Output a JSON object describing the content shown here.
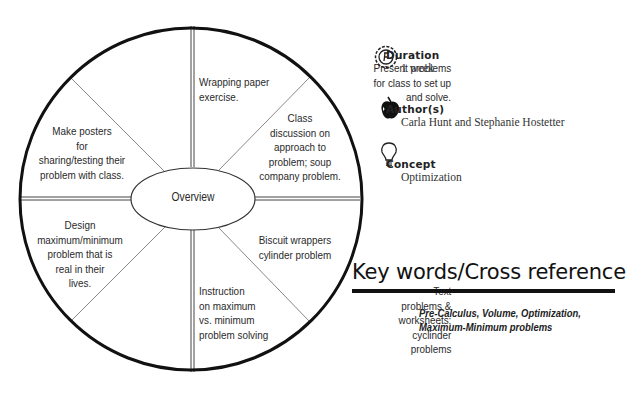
{
  "wheel": {
    "center_label": "Overview",
    "segments": [
      {
        "position": "top-left",
        "lines": [
          "Present problems",
          "for class to set up",
          "and solve."
        ]
      },
      {
        "position": "top-right",
        "lines": [
          "Wrapping paper",
          "exercise."
        ]
      },
      {
        "position": "right-upper",
        "lines": [
          "Class",
          "discussion on",
          "approach to",
          "problem; soup",
          "company problem."
        ]
      },
      {
        "position": "right-lower",
        "lines": [
          "Biscuit wrappers",
          "cylinder problem"
        ]
      },
      {
        "position": "bottom-right",
        "lines": [
          "Instruction",
          "on maximum",
          "vs. minimum",
          "problem solving"
        ]
      },
      {
        "position": "bottom-left",
        "lines": [
          "Text",
          "problems &",
          "worksheets;",
          "cyclinder",
          "problems"
        ]
      },
      {
        "position": "left-lower",
        "lines": [
          "Design",
          "maximum/minimum",
          "problem that is",
          "real in their",
          "lives."
        ]
      },
      {
        "position": "left-upper",
        "lines": [
          "Make posters",
          "for",
          "sharing/testing their",
          "problem with class."
        ]
      }
    ]
  },
  "info": {
    "duration": {
      "icon": "clock-icon",
      "heading": "Duration",
      "value": "1 week"
    },
    "authors": {
      "icon": "apple-icon",
      "heading": "Author(s)",
      "value": "Carla Hunt and Stephanie Hostetter"
    },
    "concept": {
      "icon": "lightbulb-icon",
      "heading": "Concept",
      "value": "Optimization"
    }
  },
  "keywords": {
    "heading": "Key words/Cross reference",
    "lines": [
      "Pre-Calculus, Volume, Optimization,",
      "Maximum-Minimum problems"
    ]
  }
}
